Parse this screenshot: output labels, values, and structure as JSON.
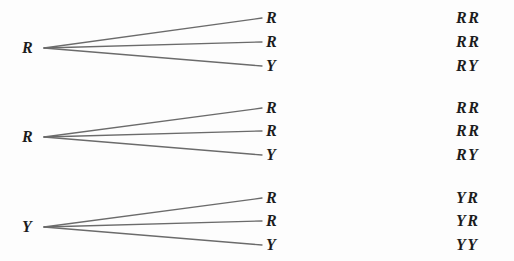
{
  "diagram": {
    "background_color": "#fdfdfd",
    "line_color": "#6b6b6b",
    "text_color": "#1c1c1c",
    "groups": [
      {
        "parent": "R",
        "parent_x": 22,
        "origin_x": 44,
        "origin_y": 48,
        "children": [
          {
            "allele": "R",
            "y": 18,
            "genotype": "RR"
          },
          {
            "allele": "R",
            "y": 42,
            "genotype": "RR"
          },
          {
            "allele": "Y",
            "y": 66,
            "genotype": "RY"
          }
        ]
      },
      {
        "parent": "R",
        "parent_x": 22,
        "origin_x": 44,
        "origin_y": 137,
        "children": [
          {
            "allele": "R",
            "y": 108,
            "genotype": "RR"
          },
          {
            "allele": "R",
            "y": 131,
            "genotype": "RR"
          },
          {
            "allele": "Y",
            "y": 155,
            "genotype": "RY"
          }
        ]
      },
      {
        "parent": "Y",
        "parent_x": 22,
        "origin_x": 44,
        "origin_y": 227,
        "children": [
          {
            "allele": "R",
            "y": 198,
            "genotype": "YR"
          },
          {
            "allele": "R",
            "y": 221,
            "genotype": "YR"
          },
          {
            "allele": "Y",
            "y": 245,
            "genotype": "YY"
          }
        ]
      }
    ],
    "geometry": {
      "branch_end_x": 262,
      "child_label_x": 266,
      "genotype_label_x": 456
    }
  }
}
